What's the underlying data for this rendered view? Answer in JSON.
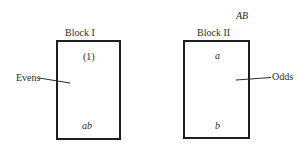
{
  "diagram": {
    "corner_label": "AB",
    "blocks": [
      {
        "title": "Block I",
        "top_treatment": "(1)",
        "bottom_treatment": "ab",
        "side_label": "Evens"
      },
      {
        "title": "Block II",
        "top_treatment": "a",
        "bottom_treatment": "b",
        "side_label": "Odds"
      }
    ]
  },
  "colors": {
    "stroke": "#1e1e1e",
    "text": "#2a2a2a",
    "background": "#ffffff"
  }
}
